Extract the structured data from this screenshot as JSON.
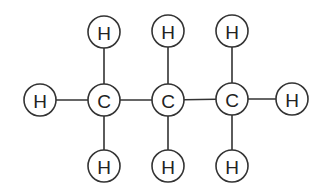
{
  "diagram": {
    "atom_radius": 16,
    "atoms": [
      {
        "id": "H1",
        "label": "H",
        "x": 40,
        "y": 100
      },
      {
        "id": "C1",
        "label": "C",
        "x": 104,
        "y": 100
      },
      {
        "id": "C2",
        "label": "C",
        "x": 168,
        "y": 100
      },
      {
        "id": "C3",
        "label": "C",
        "x": 232,
        "y": 99
      },
      {
        "id": "H2",
        "label": "H",
        "x": 292,
        "y": 99
      },
      {
        "id": "H3",
        "label": "H",
        "x": 104,
        "y": 32
      },
      {
        "id": "H4",
        "label": "H",
        "x": 168,
        "y": 31
      },
      {
        "id": "H5",
        "label": "H",
        "x": 232,
        "y": 31
      },
      {
        "id": "H6",
        "label": "H",
        "x": 104,
        "y": 166
      },
      {
        "id": "H7",
        "label": "H",
        "x": 168,
        "y": 166
      },
      {
        "id": "H8",
        "label": "H",
        "x": 232,
        "y": 166
      }
    ],
    "bonds": [
      [
        "H1",
        "C1"
      ],
      [
        "C1",
        "C2"
      ],
      [
        "C2",
        "C3"
      ],
      [
        "C3",
        "H2"
      ],
      [
        "C1",
        "H3"
      ],
      [
        "C2",
        "H4"
      ],
      [
        "C3",
        "H5"
      ],
      [
        "C1",
        "H6"
      ],
      [
        "C2",
        "H7"
      ],
      [
        "C3",
        "H8"
      ]
    ]
  }
}
